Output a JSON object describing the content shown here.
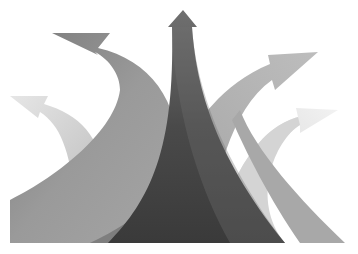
{
  "image": {
    "description": "Grayscale illustration of five curved arrows diverging from a common base",
    "background": "#ffffff",
    "arrows": [
      {
        "name": "far-left-arrow",
        "direction": "up-left",
        "color": "#d9d9d9"
      },
      {
        "name": "left-arrow",
        "direction": "up-left",
        "color": "#8a8a8a"
      },
      {
        "name": "center-arrow",
        "direction": "up",
        "color": "#6a6a6a"
      },
      {
        "name": "right-arrow",
        "direction": "up-right",
        "color": "#b0b0b0"
      },
      {
        "name": "far-right-arrow",
        "direction": "right",
        "color": "#e4e4e4"
      }
    ],
    "base_shadow_color": "#3c3c3c"
  }
}
